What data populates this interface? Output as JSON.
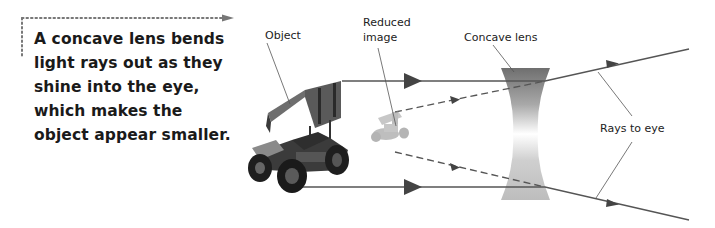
{
  "caption": {
    "lines": [
      "A concave lens bends",
      "light rays out as they",
      "shine into the eye,",
      "which makes the",
      "object appear smaller."
    ]
  },
  "labels": {
    "object": "Object",
    "reduced_image": [
      "Reduced",
      "image"
    ],
    "concave_lens": "Concave lens",
    "rays_to_eye": "Rays to eye"
  },
  "colors": {
    "ray": "#555555",
    "arrowhead": "#444444",
    "lens_top": "#7a7a7a",
    "lens_mid": "#ffffff",
    "text": "#1a1a1a",
    "dotted_pointer": "#666666"
  },
  "icons": {
    "object": "race-car-icon",
    "reduced_image": "small-race-car-icon",
    "lens": "concave-lens-icon"
  }
}
